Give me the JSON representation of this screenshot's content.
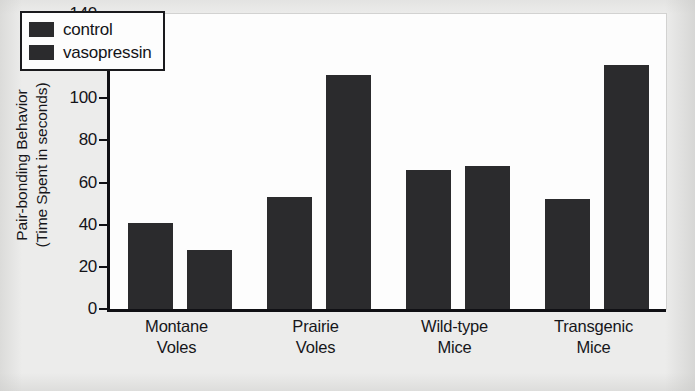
{
  "chart_data": {
    "type": "bar",
    "title": "",
    "xlabel": "",
    "ylabel": "Pair-bonding Behavior (Time Spent in seconds)",
    "ylabel_lines": [
      "Pair-bonding Behavior",
      "(Time Spent in seconds)"
    ],
    "categories": [
      "Montane Voles",
      "Prairie Voles",
      "Wild-type Mice",
      "Transgenic Mice"
    ],
    "category_lines": [
      [
        "Montane",
        "Voles"
      ],
      [
        "Prairie",
        "Voles"
      ],
      [
        "Wild-type",
        "Mice"
      ],
      [
        "Transgenic",
        "Mice"
      ]
    ],
    "series": [
      {
        "name": "control",
        "values": [
          41,
          53,
          66,
          52
        ]
      },
      {
        "name": "vasopressin",
        "values": [
          28,
          111,
          68,
          116
        ]
      }
    ],
    "ylim": [
      0,
      140
    ],
    "yticks": [
      0,
      20,
      40,
      60,
      80,
      100,
      120,
      140
    ],
    "grid": false,
    "legend_position": "top-left",
    "bar_color": "#2b2b2d",
    "axis_color": "#101014",
    "plot_background": "#fdfdfd",
    "page_background": "#ececeb"
  },
  "legend": {
    "entries": [
      {
        "label": "control"
      },
      {
        "label": "vasopressin"
      }
    ]
  }
}
